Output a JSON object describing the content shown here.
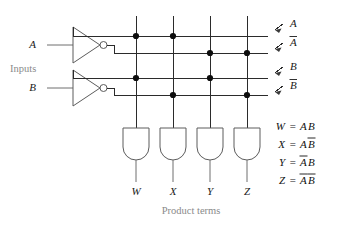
{
  "figure": {
    "caption": "Product terms",
    "inputs_label": "Inputs"
  },
  "inputs": [
    {
      "name": "input-a",
      "label": "A"
    },
    {
      "name": "input-b",
      "label": "B"
    }
  ],
  "rails": [
    {
      "id": "rail-a",
      "label": "A",
      "overbar": false,
      "y": 36
    },
    {
      "id": "rail-abar",
      "label": "A",
      "overbar": true,
      "y": 53
    },
    {
      "id": "rail-b",
      "label": "B",
      "overbar": false,
      "y": 78
    },
    {
      "id": "rail-bbar",
      "label": "B",
      "overbar": true,
      "y": 95
    }
  ],
  "columns": [
    {
      "id": "col-w",
      "label": "W",
      "x": 136,
      "connects": [
        "rail-a",
        "rail-b"
      ]
    },
    {
      "id": "col-x",
      "label": "X",
      "x": 173,
      "connects": [
        "rail-a",
        "rail-bbar"
      ]
    },
    {
      "id": "col-y",
      "label": "Y",
      "x": 210,
      "connects": [
        "rail-abar",
        "rail-b"
      ]
    },
    {
      "id": "col-z",
      "label": "Z",
      "x": 247,
      "connects": [
        "rail-abar",
        "rail-bbar"
      ]
    }
  ],
  "equations": [
    {
      "id": "eq-w",
      "lhs": "W",
      "terms": [
        {
          "text": "A",
          "overbar": false
        },
        {
          "text": "B",
          "overbar": false
        }
      ]
    },
    {
      "id": "eq-x",
      "lhs": "X",
      "terms": [
        {
          "text": "A",
          "overbar": false
        },
        {
          "text": "B",
          "overbar": true
        }
      ]
    },
    {
      "id": "eq-y",
      "lhs": "Y",
      "terms": [
        {
          "text": "A",
          "overbar": true
        },
        {
          "text": "B",
          "overbar": false
        }
      ]
    },
    {
      "id": "eq-z",
      "lhs": "Z",
      "terms": [
        {
          "text": "A",
          "overbar": true
        },
        {
          "text": "B",
          "overbar": true
        }
      ]
    }
  ],
  "colors": {
    "wire": "#2b2b2b",
    "wire_soft": "#6e6e6e",
    "gate": "#5c5c5c",
    "junction": "#0d0d0d",
    "text": "#1a1a1a",
    "muted_text": "#8a8a8a",
    "background": "#ffffff"
  }
}
